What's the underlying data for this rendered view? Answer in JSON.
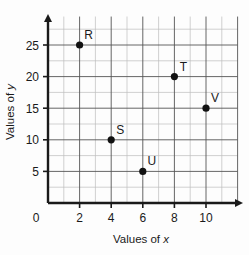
{
  "chart_data": {
    "type": "scatter",
    "title": "",
    "xlabel": "Values of x",
    "ylabel": "Values of y",
    "xlabel_prefix": "Values of ",
    "xlabel_var": "x",
    "ylabel_prefix": "Values of ",
    "ylabel_var": "y",
    "xlim": [
      0,
      12
    ],
    "ylim": [
      0,
      30
    ],
    "xticks": [
      0,
      2,
      4,
      6,
      8,
      10
    ],
    "yticks": [
      0,
      5,
      10,
      15,
      20,
      25
    ],
    "xtick_labels": [
      "0",
      "2",
      "4",
      "6",
      "8",
      "10"
    ],
    "ytick_labels": [
      "0",
      "5",
      "10",
      "15",
      "20",
      "25"
    ],
    "grid": true,
    "grid_x_step": 1,
    "grid_y_step": 2.5,
    "legend": "none",
    "origin_label": "0",
    "axis_arrows": true,
    "points": [
      {
        "label": "R",
        "x": 2,
        "y": 25,
        "label_dx": 9,
        "label_dy": -6
      },
      {
        "label": "S",
        "x": 4,
        "y": 10,
        "label_dx": 9,
        "label_dy": -6
      },
      {
        "label": "T",
        "x": 8,
        "y": 20,
        "label_dx": 9,
        "label_dy": -6
      },
      {
        "label": "U",
        "x": 6,
        "y": 5,
        "label_dx": 9,
        "label_dy": -6
      },
      {
        "label": "V",
        "x": 10,
        "y": 15,
        "label_dx": 9,
        "label_dy": -6
      }
    ],
    "colors": {
      "background": "#fdfdfd",
      "axis": "#1a1a1a",
      "grid_major": "#4a4a4a",
      "grid_minor": "#b9b9b9",
      "point": "#111111",
      "text": "#1a1a1a"
    }
  }
}
